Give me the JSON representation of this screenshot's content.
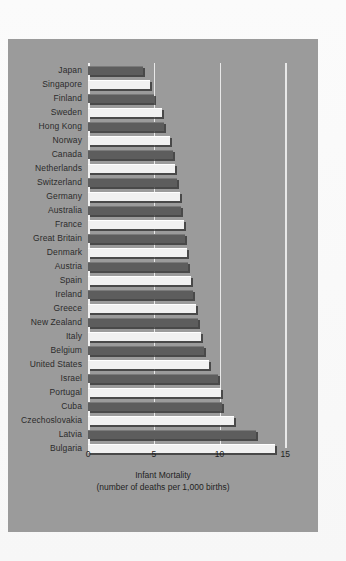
{
  "chart_data": {
    "type": "bar",
    "orientation": "horizontal",
    "title": "",
    "xlabel": "Infant Mortality",
    "xsublabel": "(number of deaths per 1,000 births)",
    "ylabel": "",
    "xlim": [
      0,
      15
    ],
    "xticks": [
      "0",
      "5",
      "10",
      "15"
    ],
    "xtickvalues": [
      0,
      5,
      10,
      15
    ],
    "grid": "vertical",
    "legend": "none",
    "categories": [
      "Japan",
      "Singapore",
      "Finland",
      "Sweden",
      "Hong Kong",
      "Norway",
      "Canada",
      "Netherlands",
      "Switzerland",
      "Germany",
      "Australia",
      "France",
      "Great Britain",
      "Denmark",
      "Austria",
      "Spain",
      "Ireland",
      "Greece",
      "New Zealand",
      "Italy",
      "Belgium",
      "United States",
      "Israel",
      "Portugal",
      "Cuba",
      "Czechoslovakia",
      "Latvia",
      "Bulgaria"
    ],
    "values": [
      4.2,
      4.7,
      5.0,
      5.6,
      5.8,
      6.2,
      6.5,
      6.6,
      6.8,
      7.0,
      7.1,
      7.3,
      7.4,
      7.5,
      7.6,
      7.8,
      8.0,
      8.2,
      8.4,
      8.6,
      8.8,
      9.2,
      9.9,
      10.1,
      10.2,
      11.1,
      12.8,
      14.2
    ],
    "bar_colors": [
      "dark",
      "light",
      "dark",
      "light",
      "dark",
      "light",
      "dark",
      "light",
      "dark",
      "light",
      "dark",
      "light",
      "dark",
      "light",
      "dark",
      "light",
      "dark",
      "light",
      "dark",
      "light",
      "dark",
      "light",
      "dark",
      "light",
      "dark",
      "light",
      "dark",
      "light"
    ],
    "colors": {
      "panel_background": "#9b9b9b",
      "page_background": "#fdfdfd",
      "bar_dark": "#5d5d5d",
      "bar_light": "#f1f1f1",
      "gridline": "#e8e8e8",
      "text": "#1f1f1f"
    }
  }
}
